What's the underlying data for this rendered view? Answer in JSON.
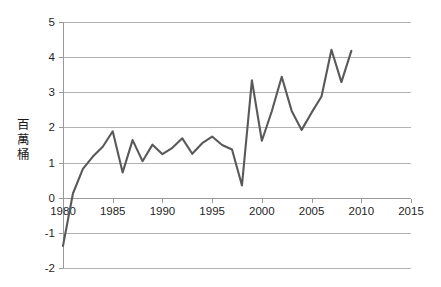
{
  "chart_data": {
    "type": "line",
    "title": "",
    "xlabel": "",
    "ylabel": "百萬桶",
    "ylabel_chars": [
      "百",
      "萬",
      "桶"
    ],
    "xlim": [
      1980,
      2015
    ],
    "ylim": [
      -2,
      5
    ],
    "grid": true,
    "legend": false,
    "legend_position": "none",
    "y_ticks": [
      "5",
      "4",
      "3",
      "2",
      "1",
      "0",
      "-1",
      "-2"
    ],
    "y_tick_values": [
      5,
      4,
      3,
      2,
      1,
      0,
      -1,
      -2
    ],
    "x_ticks": [
      "1980",
      "1985",
      "1990",
      "1995",
      "2000",
      "2005",
      "2010",
      "2015"
    ],
    "x_tick_values": [
      1980,
      1985,
      1990,
      1995,
      2000,
      2005,
      2010,
      2015
    ],
    "line_color": "#595959",
    "grid_color": "#b3b3b3",
    "x": [
      1980,
      1981,
      1982,
      1983,
      1984,
      1985,
      1986,
      1987,
      1988,
      1989,
      1990,
      1991,
      1992,
      1993,
      1994,
      1995,
      1996,
      1997,
      1998,
      1999,
      2000,
      2001,
      2002,
      2003,
      2004,
      2005,
      2006,
      2007,
      2008,
      2009
    ],
    "values": [
      -1.37,
      0.12,
      0.82,
      1.17,
      1.45,
      1.89,
      0.72,
      1.64,
      1.04,
      1.51,
      1.24,
      1.42,
      1.69,
      1.25,
      1.55,
      1.74,
      1.5,
      1.37,
      0.35,
      3.34,
      1.62,
      2.46,
      3.44,
      2.47,
      1.93,
      2.42,
      2.88,
      4.21,
      3.29,
      4.18
    ],
    "series": [
      {
        "name": "",
        "values": [
          -1.37,
          0.12,
          0.82,
          1.17,
          1.45,
          1.89,
          0.72,
          1.64,
          1.04,
          1.51,
          1.24,
          1.42,
          1.69,
          1.25,
          1.55,
          1.74,
          1.5,
          1.37,
          0.35,
          3.34,
          1.62,
          2.46,
          3.44,
          2.47,
          1.93,
          2.42,
          2.88,
          4.21,
          3.29,
          4.18
        ]
      }
    ]
  },
  "plot_geometry": {
    "left": 63,
    "right": 411,
    "top": 22,
    "bottom": 268
  }
}
